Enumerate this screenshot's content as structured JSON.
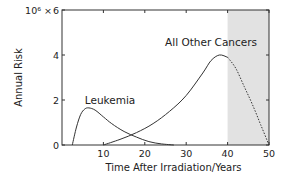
{
  "chart_data": {
    "type": "line",
    "title": "",
    "xlabel": "Time After Irradiation/Years",
    "ylabel": "Annual Risk",
    "y_multiplier_label": "10⁶ ×",
    "xlim": [
      0,
      50
    ],
    "ylim": [
      0,
      6
    ],
    "x_ticks": [
      10,
      20,
      30,
      40,
      50
    ],
    "y_ticks": [
      0,
      2,
      4,
      6
    ],
    "grid": false,
    "legend": "none (inline annotations)",
    "shaded_region": {
      "x_start": 40,
      "x_end": 50,
      "color": "#e2e2e2"
    },
    "series": [
      {
        "name": "Leukemia",
        "x": [
          2.5,
          3.5,
          4.5,
          5.5,
          6.5,
          8,
          10,
          12,
          15,
          18,
          21,
          24,
          27
        ],
        "values": [
          0,
          0.8,
          1.35,
          1.6,
          1.65,
          1.55,
          1.25,
          0.95,
          0.6,
          0.35,
          0.15,
          0.05,
          0
        ]
      },
      {
        "name": "All Other Cancers",
        "x": [
          10,
          14,
          18,
          22,
          26,
          30,
          34,
          36,
          38,
          40,
          42,
          44,
          46,
          48,
          50
        ],
        "values": [
          0,
          0.25,
          0.55,
          0.95,
          1.5,
          2.2,
          3.2,
          3.75,
          4.0,
          3.9,
          3.4,
          2.6,
          1.8,
          0.9,
          0
        ],
        "dotted_after_x": 40
      }
    ],
    "annotations": [
      {
        "text": "Leukemia",
        "x": 5.5,
        "y": 2.0
      },
      {
        "text": "All Other Cancers",
        "x": 36,
        "y": 4.6
      }
    ]
  },
  "labels": {
    "xlabel": "Time After Irradiation/Years",
    "ylabel": "Annual Risk",
    "ymult": "10⁶ ×",
    "x_ticks": [
      "10",
      "20",
      "30",
      "40",
      "50"
    ],
    "y_ticks": [
      "0",
      "2",
      "4",
      "6"
    ],
    "leukemia": "Leukemia",
    "other": "All Other Cancers"
  },
  "colors": {
    "line": "#333333",
    "shade": "#e2e2e2",
    "axis": "#333333"
  }
}
